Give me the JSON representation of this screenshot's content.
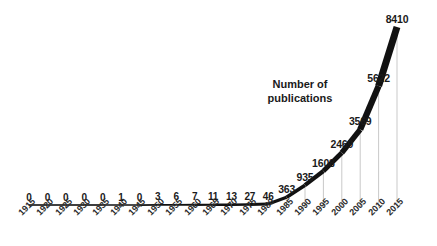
{
  "chart_data": {
    "type": "line",
    "title": "",
    "subtitle": "",
    "xlabel": "",
    "ylabel": "",
    "annotation": "Number of\npublications",
    "annotation_x_px": 300,
    "annotation_y_px": 78,
    "grid": false,
    "legend": "none",
    "show_data_labels": true,
    "line_color": "#111111",
    "dropline_color": "#c9c9c9",
    "label_color": "#1a1a1a",
    "background_color": "#ffffff",
    "xlim": [
      1915,
      2015
    ],
    "ylim": [
      0,
      8410
    ],
    "categories": [
      "1915",
      "1920",
      "1925",
      "1930",
      "1935",
      "1940",
      "1945",
      "1950",
      "1955",
      "1960",
      "1965",
      "1970",
      "1975",
      "1980",
      "1985",
      "1990",
      "1995",
      "2000",
      "2005",
      "2010",
      "2015"
    ],
    "values": [
      0,
      0,
      0,
      0,
      0,
      1,
      0,
      3,
      6,
      7,
      11,
      13,
      27,
      46,
      363,
      935,
      1608,
      2469,
      3569,
      5622,
      8410
    ],
    "point_labels": [
      "0",
      "0",
      "0",
      "0",
      "0",
      "1",
      "0",
      "3",
      "6",
      "7",
      "11",
      "13",
      "27",
      "46",
      "363",
      "935",
      "1608",
      "2469",
      "3569",
      "5622",
      "8410"
    ]
  }
}
